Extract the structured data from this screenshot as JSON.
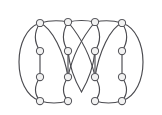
{
  "figure": {
    "kind": "graph-drawing",
    "background_color": "#ffffff",
    "edge_color": "#4a4a4f",
    "node_fill_color": "#f2f2f2",
    "node_stroke_color": "#58585d",
    "node_radius": 3.6,
    "edge_width": 1.15,
    "width": 162,
    "height": 115,
    "node_count": 16,
    "edge_count": 24,
    "row_count": 4,
    "column_count": 4
  },
  "chart_data": {
    "type": "scatter",
    "title": "",
    "xlabel": "",
    "ylabel": "",
    "xlim": [
      0,
      162
    ],
    "ylim": [
      0,
      115
    ],
    "grid": false,
    "legend": false,
    "nodes": [
      {
        "id": "n1",
        "row": 1,
        "col": 1,
        "x": 40,
        "y": 23
      },
      {
        "id": "n2",
        "row": 1,
        "col": 2,
        "x": 68,
        "y": 22
      },
      {
        "id": "n3",
        "row": 1,
        "col": 3,
        "x": 95,
        "y": 22
      },
      {
        "id": "n4",
        "row": 1,
        "col": 4,
        "x": 122,
        "y": 23
      },
      {
        "id": "n5",
        "row": 2,
        "col": 1,
        "x": 40,
        "y": 51
      },
      {
        "id": "n6",
        "row": 2,
        "col": 2,
        "x": 68,
        "y": 51
      },
      {
        "id": "n7",
        "row": 2,
        "col": 3,
        "x": 95,
        "y": 51
      },
      {
        "id": "n8",
        "row": 2,
        "col": 4,
        "x": 122,
        "y": 51
      },
      {
        "id": "n9",
        "row": 3,
        "col": 1,
        "x": 40,
        "y": 77
      },
      {
        "id": "n10",
        "row": 3,
        "col": 2,
        "x": 68,
        "y": 77
      },
      {
        "id": "n11",
        "row": 3,
        "col": 3,
        "x": 95,
        "y": 77
      },
      {
        "id": "n12",
        "row": 3,
        "col": 4,
        "x": 122,
        "y": 77
      },
      {
        "id": "n13",
        "row": 4,
        "col": 1,
        "x": 40,
        "y": 101
      },
      {
        "id": "n14",
        "row": 4,
        "col": 2,
        "x": 68,
        "y": 101
      },
      {
        "id": "n15",
        "row": 4,
        "col": 3,
        "x": 95,
        "y": 101
      },
      {
        "id": "n16",
        "row": 4,
        "col": 4,
        "x": 122,
        "y": 101
      }
    ],
    "edges": [
      {
        "id": "e-top-1-2",
        "from": "n1",
        "to": "n2",
        "path": "M 40 23 Q 54 19 68 22"
      },
      {
        "id": "e-top-2-3",
        "from": "n2",
        "to": "n3",
        "path": "M 68 22 Q 81.5 19 95 22"
      },
      {
        "id": "e-top-3-4",
        "from": "n3",
        "to": "n4",
        "path": "M 95 22 Q 108.5 19 122 23"
      },
      {
        "id": "e-bot-13-14",
        "from": "n13",
        "to": "n14",
        "path": "M 40 101 Q 54 105 68 101"
      },
      {
        "id": "e-bot-15-16",
        "from": "n15",
        "to": "n16",
        "path": "M 95 101 Q 108.5 105 122 101"
      },
      {
        "id": "e-outer-left",
        "from": "n1",
        "to": "n13",
        "path": "M 40 23 C 12 32 12 92 40 101"
      },
      {
        "id": "e-outer-right",
        "from": "n4",
        "to": "n16",
        "path": "M 122 23 C 150 32 150 92 122 101"
      },
      {
        "id": "e-arc-1-14",
        "from": "n1",
        "to": "n14",
        "path": "M 40 23 C 52 28 64 52 68 77"
      },
      {
        "id": "e-arc-4-15",
        "from": "n4",
        "to": "n15",
        "path": "M 122 23 C 110 28 99 52 95 77"
      },
      {
        "id": "e-cross-2-11",
        "from": "n2",
        "to": "n11",
        "path": "M 68 22 C 78 34 90 52 95 77"
      },
      {
        "id": "e-cross-3-10",
        "from": "n3",
        "to": "n10",
        "path": "M 95 22 C 85 34 73 52 68 77"
      },
      {
        "id": "e-col1-1-5",
        "from": "n1",
        "to": "n5",
        "path": "M 40 23 C 34 32 34 42 40 51"
      },
      {
        "id": "e-col1-5-9",
        "from": "n5",
        "to": "n9",
        "path": "M 40 51 L 40 77"
      },
      {
        "id": "e-col1-9-13",
        "from": "n9",
        "to": "n13",
        "path": "M 40 77 C 34 86 34 94 40 101"
      },
      {
        "id": "e-col2-2-6",
        "from": "n2",
        "to": "n6",
        "path": "M 68 22 C 62 32 62 42 68 51"
      },
      {
        "id": "e-col2-6-10",
        "from": "n6",
        "to": "n10",
        "path": "M 68 51 L 68 77"
      },
      {
        "id": "e-col2-10-14",
        "from": "n10",
        "to": "n14",
        "path": "M 68 77 C 62 86 62 94 68 101"
      },
      {
        "id": "e-col3-3-7",
        "from": "n3",
        "to": "n7",
        "path": "M 95 22 C 101 32 101 42 95 51"
      },
      {
        "id": "e-col3-7-11",
        "from": "n7",
        "to": "n11",
        "path": "M 95 51 L 95 77"
      },
      {
        "id": "e-col3-11-15",
        "from": "n11",
        "to": "n15",
        "path": "M 95 77 C 101 86 101 94 95 101"
      },
      {
        "id": "e-col4-4-8",
        "from": "n4",
        "to": "n8",
        "path": "M 122 23 C 128 32 128 42 122 51"
      },
      {
        "id": "e-col4-8-12",
        "from": "n8",
        "to": "n12",
        "path": "M 122 51 L 122 77"
      },
      {
        "id": "e-col4-12-16",
        "from": "n12",
        "to": "n16",
        "path": "M 122 77 C 128 86 128 94 122 101"
      },
      {
        "id": "e-vee-6-7",
        "from": "n6",
        "to": "n7",
        "path": "M 68 51 C 70 72 78 86 81.5 92 C 85 86 93 72 95 51"
      }
    ]
  }
}
